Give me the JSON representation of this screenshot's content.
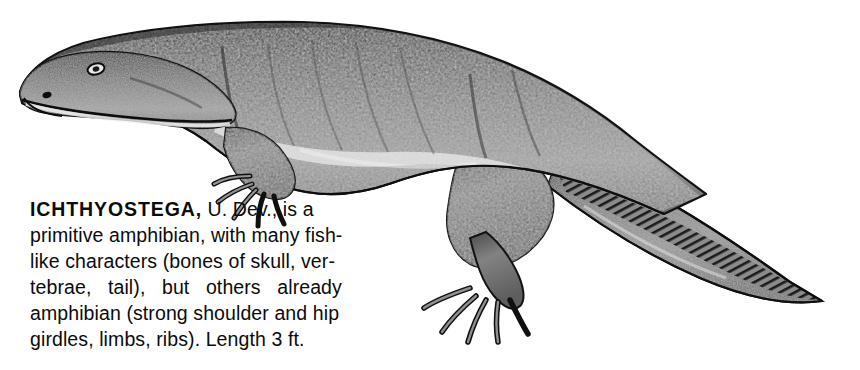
{
  "plate": {
    "background_color": "#ffffff",
    "subject": "Ichthyostega",
    "illustration_style": "stippled grayscale scientific reconstruction",
    "ink_color": "#0b0b0b",
    "body_gray": "#808080",
    "body_shadow_gray": "#3a3a3a",
    "body_highlight_gray": "#d8d8d8"
  },
  "caption": {
    "genus": "ICHTHYOSTEGA,",
    "line1_rest": " U. Dev., is a",
    "lines": [
      "primitive amphibian, with many fish-",
      "like characters (bones of skull, ver-",
      "tebrae,   tail),   but   others   already",
      "amphibian (strong shoulder and hip",
      "girdles, limbs, ribs). Length 3 ft."
    ],
    "full_text": "ICHTHYOSTEGA, U. Dev., is a primitive amphibian, with many fish-like characters (bones of skull, vertebrae, tail), but others already amphibian (strong shoulder and hip girdles, limbs, ribs). Length 3 ft.",
    "age": "U. Dev.",
    "length": "3 ft."
  },
  "figure": {
    "label": "ichthyostega-illustration",
    "parts": [
      "head",
      "eye",
      "nostril",
      "mouth-line",
      "trunk",
      "dorsal-ridge",
      "flank-highlight",
      "forelimb",
      "forelimb-digits",
      "hindlimb",
      "hindlimb-digits",
      "tail",
      "tail-fin-rays",
      "tail-tip"
    ]
  }
}
